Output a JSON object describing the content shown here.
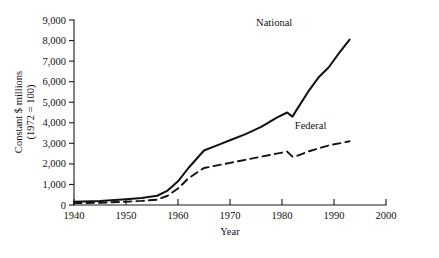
{
  "chart_data": {
    "type": "line",
    "title": "",
    "xlabel": "Year",
    "ylabel": "Constant $ millions (1972 = 100)",
    "ylabel_line1": "Constant $ millions",
    "ylabel_line2": "(1972 = 100)",
    "xlim": [
      1940,
      2000
    ],
    "ylim": [
      0,
      9000
    ],
    "grid": false,
    "legend_position": "inline-annotation",
    "xticks": [
      1940,
      1950,
      1960,
      1970,
      1980,
      1990,
      2000
    ],
    "xtick_labels": [
      "1940",
      "1950",
      "1960",
      "1970",
      "1980",
      "1990",
      "2000"
    ],
    "yticks": [
      0,
      1000,
      2000,
      3000,
      4000,
      5000,
      6000,
      7000,
      8000,
      9000
    ],
    "ytick_labels": [
      "0",
      "1,000",
      "2,000",
      "3,000",
      "4,000",
      "5,000",
      "6,000",
      "7,000",
      "8,000",
      "9,000"
    ],
    "series": [
      {
        "name": "National",
        "style": "solid",
        "color": "#111111",
        "label_x": 1978.5,
        "label_y": 8700,
        "x": [
          1940,
          1945,
          1950,
          1953,
          1956,
          1958,
          1960,
          1962,
          1965,
          1968,
          1970,
          1973,
          1976,
          1979,
          1981,
          1982,
          1983,
          1985,
          1987,
          1989,
          1991,
          1993
        ],
        "values": [
          160,
          200,
          280,
          340,
          450,
          700,
          1150,
          1800,
          2650,
          2950,
          3150,
          3450,
          3800,
          4250,
          4500,
          4300,
          4700,
          5500,
          6200,
          6700,
          7400,
          8050
        ]
      },
      {
        "name": "Federal",
        "style": "dashed",
        "color": "#111111",
        "label_x": 1985.5,
        "label_y": 3720,
        "x": [
          1940,
          1945,
          1950,
          1953,
          1956,
          1958,
          1960,
          1962,
          1965,
          1968,
          1970,
          1973,
          1976,
          1979,
          1981,
          1982,
          1983,
          1985,
          1987,
          1989,
          1991,
          1993
        ],
        "values": [
          90,
          110,
          160,
          200,
          260,
          450,
          800,
          1300,
          1800,
          1950,
          2050,
          2200,
          2350,
          2500,
          2600,
          2350,
          2400,
          2600,
          2750,
          2900,
          3000,
          3100
        ]
      }
    ]
  }
}
